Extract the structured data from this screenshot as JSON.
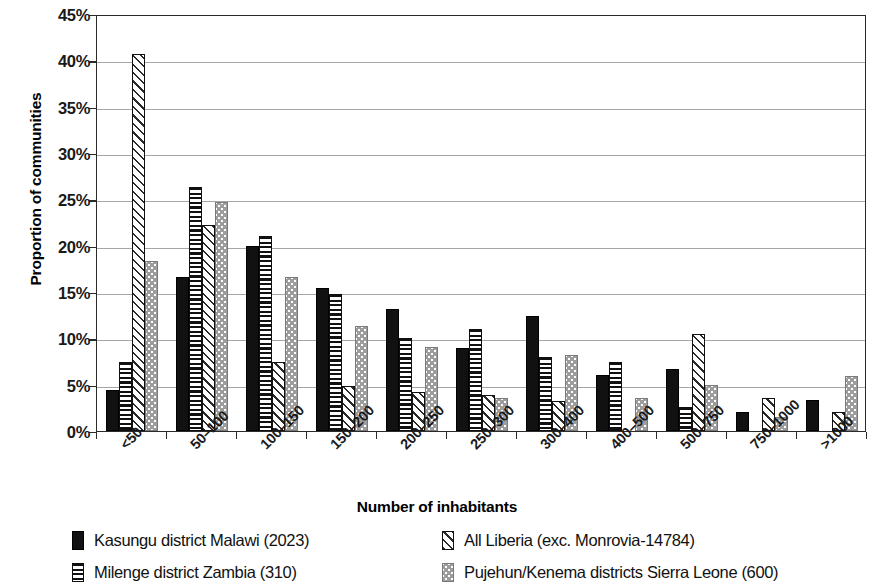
{
  "chart_data": {
    "type": "bar",
    "title": "",
    "xlabel": "Number of inhabitants",
    "ylabel": "Proportion of communities",
    "ylim": [
      0,
      45
    ],
    "ytick_labels": [
      "0%",
      "5%",
      "10%",
      "15%",
      "20%",
      "25%",
      "30%",
      "35%",
      "40%",
      "45%"
    ],
    "ytick_values": [
      0,
      5,
      10,
      15,
      20,
      25,
      30,
      35,
      40,
      45
    ],
    "grid": "horizontal",
    "legend_position": "bottom",
    "categories": [
      "<50",
      "50–100",
      "100–150",
      "150–200",
      "200–250",
      "250–300",
      "300–400",
      "400–500",
      "500–750",
      "750–1000",
      ">1000"
    ],
    "series": [
      {
        "name": "Kasungu district Malawi (2023)",
        "pattern": "solid-black",
        "values": [
          4.4,
          16.6,
          20.0,
          15.4,
          13.2,
          9.0,
          12.4,
          6.0,
          6.7,
          2.1,
          3.4
        ]
      },
      {
        "name": "Milenge district Zambia (310)",
        "pattern": "horizontal-stripes",
        "values": [
          7.4,
          26.3,
          21.0,
          14.8,
          10.0,
          11.0,
          8.0,
          7.4,
          2.6,
          0.0,
          0.0
        ]
      },
      {
        "name": "All Liberia (exc. Monrovia-14784)",
        "pattern": "diagonal-hatch",
        "values": [
          40.7,
          22.2,
          7.4,
          4.9,
          4.2,
          3.9,
          3.2,
          0.0,
          10.5,
          3.6,
          2.0
        ]
      },
      {
        "name": "Pujehun/Kenema districts Sierra Leone (600)",
        "pattern": "grey-dotted",
        "values": [
          18.3,
          24.7,
          16.6,
          11.3,
          9.1,
          3.6,
          8.2,
          3.6,
          5.0,
          1.5,
          5.9
        ]
      }
    ]
  },
  "legend": {
    "items": [
      {
        "label": "Kasungu district Malawi (2023)",
        "pattern": "solid-black"
      },
      {
        "label": "All Liberia (exc. Monrovia-14784)",
        "pattern": "diagonal-hatch"
      },
      {
        "label": "Milenge district Zambia (310)",
        "pattern": "horizontal-stripes"
      },
      {
        "label": "Pujehun/Kenema districts Sierra Leone (600)",
        "pattern": "grey-dotted"
      }
    ]
  }
}
